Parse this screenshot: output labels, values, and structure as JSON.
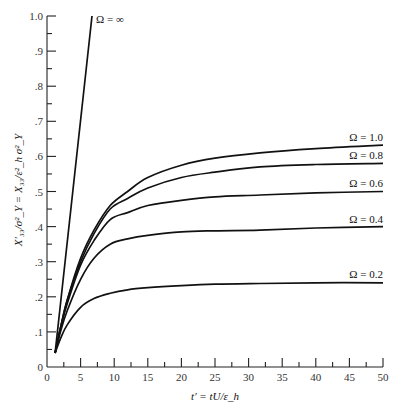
{
  "chart_data": {
    "type": "line",
    "title": "",
    "xlabel": "t′ = tU/ε_h",
    "ylabel": "X′₃₃/σ²_Y = X₃₃/ε²_h σ²_Y",
    "xlim": [
      0,
      50
    ],
    "ylim": [
      0,
      1.0
    ],
    "grid": false,
    "legend_position": "inline labels at right end of each curve",
    "x_ticks": [
      0,
      5,
      10,
      15,
      20,
      25,
      30,
      35,
      40,
      45,
      50
    ],
    "x_tick_labels": [
      "0",
      "5",
      "10",
      "15",
      "20",
      "25",
      "30",
      "35",
      "40",
      "45",
      "50"
    ],
    "y_ticks": [
      0,
      0.1,
      0.2,
      0.3,
      0.4,
      0.5,
      0.6,
      0.7,
      0.8,
      0.9,
      1.0
    ],
    "y_tick_labels": [
      "0",
      ".1",
      ".2",
      ".3",
      ".4",
      ".5",
      ".6",
      ".7",
      ".8",
      ".9",
      "1.0"
    ],
    "series": [
      {
        "name": "Ω = ∞",
        "x": [
          1.2,
          6.7
        ],
        "y": [
          0.04,
          1.0
        ]
      },
      {
        "name": "Ω = 1.0",
        "x": [
          1.2,
          2,
          3,
          5,
          7,
          9.4,
          12,
          15,
          20,
          25,
          31.7,
          40,
          50
        ],
        "y": [
          0.04,
          0.11,
          0.19,
          0.31,
          0.39,
          0.46,
          0.5,
          0.54,
          0.575,
          0.595,
          0.61,
          0.622,
          0.632
        ]
      },
      {
        "name": "Ω = 0.8",
        "x": [
          1.2,
          2,
          3,
          5,
          7,
          9.4,
          12,
          15,
          20,
          25,
          31.7,
          40,
          50
        ],
        "y": [
          0.04,
          0.11,
          0.19,
          0.3,
          0.38,
          0.45,
          0.48,
          0.51,
          0.54,
          0.555,
          0.57,
          0.577,
          0.58
        ]
      },
      {
        "name": "Ω = 0.6",
        "x": [
          1.2,
          2,
          3,
          5,
          7,
          9.4,
          12,
          15,
          20,
          25,
          31.7,
          40,
          50
        ],
        "y": [
          0.04,
          0.11,
          0.18,
          0.29,
          0.36,
          0.42,
          0.44,
          0.46,
          0.475,
          0.485,
          0.49,
          0.496,
          0.5
        ]
      },
      {
        "name": "Ω = 0.4",
        "x": [
          1.2,
          2,
          3,
          5,
          7,
          9.4,
          12,
          15,
          20,
          25,
          31.7,
          40,
          50
        ],
        "y": [
          0.04,
          0.1,
          0.16,
          0.25,
          0.31,
          0.35,
          0.365,
          0.375,
          0.385,
          0.388,
          0.39,
          0.396,
          0.4
        ]
      },
      {
        "name": "Ω = 0.2",
        "x": [
          1.2,
          2,
          3,
          5,
          7,
          9.4,
          12,
          15,
          20,
          25,
          31.7,
          40,
          50
        ],
        "y": [
          0.04,
          0.08,
          0.12,
          0.17,
          0.195,
          0.21,
          0.22,
          0.226,
          0.232,
          0.236,
          0.238,
          0.24,
          0.24
        ]
      }
    ]
  },
  "labels": {
    "omega_inf": "Ω = ∞",
    "omega_1_0": "Ω = 1.0",
    "omega_0_8": "Ω = 0.8",
    "omega_0_6": "Ω = 0.6",
    "omega_0_4": "Ω = 0.4",
    "omega_0_2": "Ω = 0.2"
  }
}
